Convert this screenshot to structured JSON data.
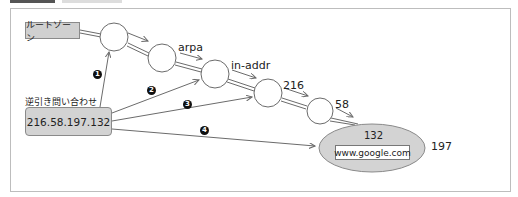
{
  "diagram": {
    "root_zone_label": "ルートゾーン",
    "query_caption": "逆引き問い合わせ",
    "query_address": "216.58.197.132",
    "zone_labels": [
      "arpa",
      "in-addr",
      "216",
      "58"
    ],
    "final_node_label": "132",
    "final_node_host": "www.google.com",
    "trailing_octet": "197",
    "steps": [
      "1",
      "2",
      "3",
      "4"
    ]
  },
  "colors": {
    "box_fill": "#d0d0d0",
    "ellipse_fill": "#d3d3d3",
    "line": "#6b6b6b",
    "frame": "#bdbdbd"
  }
}
